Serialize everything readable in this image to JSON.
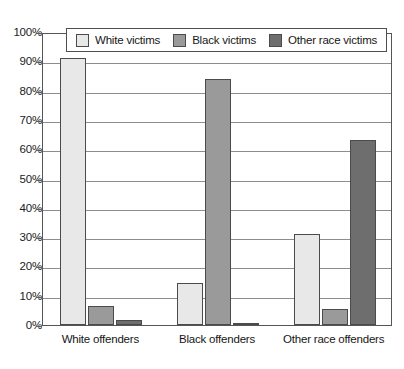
{
  "chart_data": {
    "type": "bar",
    "title": "",
    "subtitle": "",
    "xlabel": "",
    "ylabel": "",
    "ylim": [
      0,
      100
    ],
    "yticks": [
      "0%",
      "10%",
      "20%",
      "30%",
      "40%",
      "50%",
      "60%",
      "70%",
      "80%",
      "90%",
      "100%"
    ],
    "grid": true,
    "legend_position": "top-inside",
    "categories": [
      "White offenders",
      "Black offenders",
      "Other race offenders"
    ],
    "series": [
      {
        "name": "White victims",
        "color": "#e8e8e8",
        "values": [
          91,
          14.5,
          31
        ]
      },
      {
        "name": "Black victims",
        "color": "#9a9a9a",
        "values": [
          6.5,
          84,
          5.5
        ]
      },
      {
        "name": "Other race victims",
        "color": "#6e6e6e",
        "values": [
          1.7,
          0.5,
          63
        ]
      }
    ]
  },
  "colors": {
    "white_victims": "#e8e8e8",
    "black_victims": "#9a9a9a",
    "other_race_victims": "#6e6e6e",
    "bar_outline": "#4b4b4b",
    "gridline": "#8d8d8d",
    "axis": "#555555",
    "background": "#ffffff",
    "text": "#161616"
  }
}
